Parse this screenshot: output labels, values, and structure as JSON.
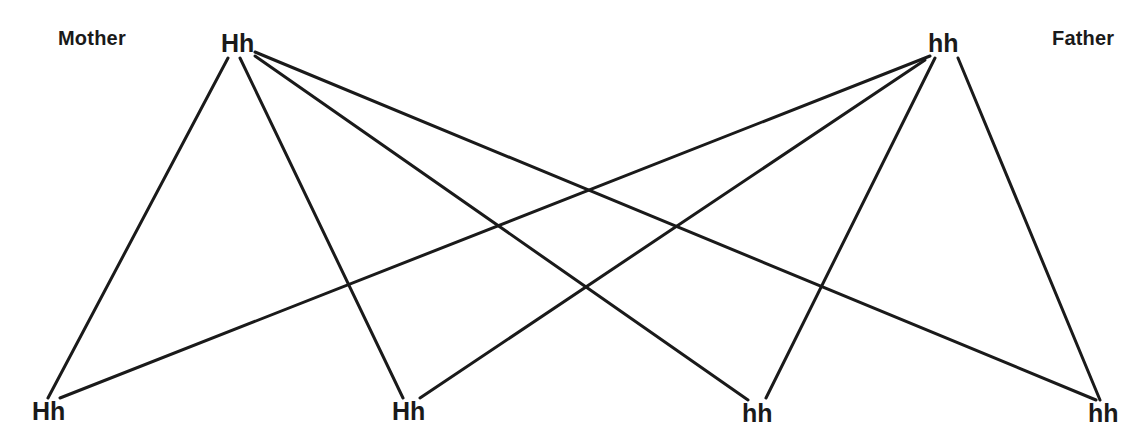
{
  "diagram": {
    "title_left": "Mother",
    "title_right": "Father",
    "parents": [
      {
        "id": "mother",
        "genotype": "Hh",
        "role": "Mother",
        "x": 237,
        "y": 45
      },
      {
        "id": "father",
        "genotype": "hh",
        "role": "Father",
        "x": 942,
        "y": 45
      }
    ],
    "offspring": [
      {
        "id": "child-1",
        "genotype": "Hh",
        "x": 50,
        "y": 412
      },
      {
        "id": "child-2",
        "genotype": "Hh",
        "x": 410,
        "y": 412
      },
      {
        "id": "child-3",
        "genotype": "hh",
        "x": 760,
        "y": 414
      },
      {
        "id": "child-4",
        "genotype": "hh",
        "x": 1106,
        "y": 414
      }
    ],
    "edges": [
      {
        "from": "mother",
        "to": "child-1",
        "x1": 228,
        "y1": 58,
        "x2": 48,
        "y2": 398
      },
      {
        "from": "mother",
        "to": "child-2",
        "x1": 240,
        "y1": 58,
        "x2": 403,
        "y2": 398
      },
      {
        "from": "mother",
        "to": "child-3",
        "x1": 255,
        "y1": 56,
        "x2": 748,
        "y2": 400
      },
      {
        "from": "mother",
        "to": "child-4",
        "x1": 255,
        "y1": 52,
        "x2": 1096,
        "y2": 400
      },
      {
        "from": "father",
        "to": "child-1",
        "x1": 930,
        "y1": 56,
        "x2": 60,
        "y2": 398
      },
      {
        "from": "father",
        "to": "child-2",
        "x1": 925,
        "y1": 60,
        "x2": 420,
        "y2": 398
      },
      {
        "from": "father",
        "to": "child-3",
        "x1": 935,
        "y1": 58,
        "x2": 766,
        "y2": 398
      },
      {
        "from": "father",
        "to": "child-4",
        "x1": 958,
        "y1": 58,
        "x2": 1100,
        "y2": 400
      }
    ],
    "line_color": "#1a1a1a",
    "line_width": 3,
    "background_color": "#ffffff",
    "text_color": "#1a1a1a"
  }
}
